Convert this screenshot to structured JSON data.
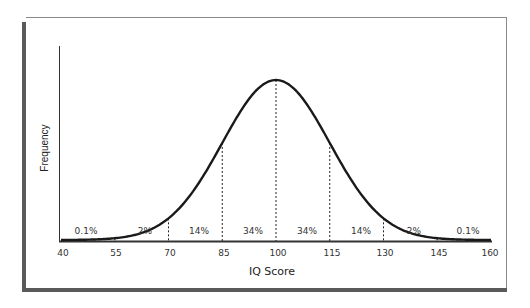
{
  "chart_data": {
    "type": "line",
    "title": "",
    "xlabel": "IQ Score",
    "ylabel": "Frequency",
    "x_ticks": [
      40,
      55,
      70,
      85,
      100,
      115,
      130,
      145,
      160
    ],
    "xlim": [
      40,
      160
    ],
    "grid": false,
    "legend": null,
    "distribution": {
      "kind": "normal",
      "mean": 100,
      "sd": 15
    },
    "dividers": [
      55,
      70,
      85,
      100,
      115,
      130,
      145
    ],
    "regions": [
      {
        "from": 40,
        "to": 55,
        "label": "0.1%"
      },
      {
        "from": 55,
        "to": 70,
        "label": "2%"
      },
      {
        "from": 70,
        "to": 85,
        "label": "14%"
      },
      {
        "from": 85,
        "to": 100,
        "label": "34%"
      },
      {
        "from": 100,
        "to": 115,
        "label": "34%"
      },
      {
        "from": 115,
        "to": 130,
        "label": "14%"
      },
      {
        "from": 130,
        "to": 145,
        "label": "2%"
      },
      {
        "from": 145,
        "to": 160,
        "label": "0.1%"
      }
    ]
  },
  "labels": {
    "x_title": "IQ Score",
    "y_title": "Frequency",
    "ticks": [
      "40",
      "55",
      "70",
      "85",
      "100",
      "115",
      "130",
      "145",
      "160"
    ],
    "regions": [
      "0.1%",
      "2%",
      "14%",
      "34%",
      "34%",
      "14%",
      "2%",
      "0.1%"
    ]
  }
}
